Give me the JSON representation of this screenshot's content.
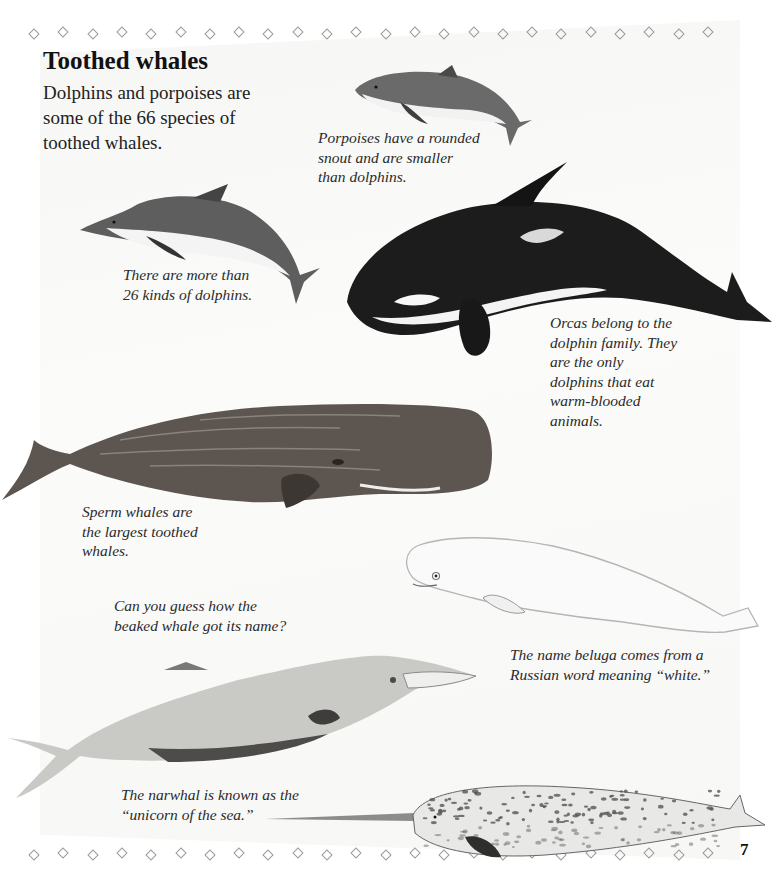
{
  "page": {
    "title": "Toothed whales",
    "intro": "Dolphins and porpoises are some of the 66 species of toothed whales.",
    "page_number": "7"
  },
  "illustrations": [
    {
      "name": "porpoise",
      "caption": "Porpoises have a rounded snout and are smaller than dolphins."
    },
    {
      "name": "dolphin",
      "caption": "There are more than 26 kinds of dolphins."
    },
    {
      "name": "orca",
      "caption": "Orcas belong to the dolphin family. They are the only dolphins that eat warm-blooded animals."
    },
    {
      "name": "sperm-whale",
      "caption": "Sperm whales are the largest toothed whales."
    },
    {
      "name": "beluga",
      "caption": "The name beluga comes from a Russian word meaning “white.”"
    },
    {
      "name": "beaked-whale",
      "caption": "Can you guess how the beaked whale got its name?"
    },
    {
      "name": "narwhal",
      "caption": "The narwhal is known as the “unicorn of the sea.”"
    }
  ],
  "decoration": {
    "border_icon": "diamond-outline-icon",
    "border_color": "#9a9a9a"
  }
}
